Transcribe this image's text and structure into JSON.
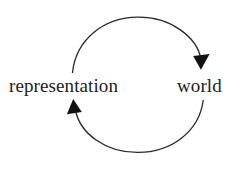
{
  "diagram": {
    "type": "cycle",
    "title": "",
    "background_color": "#ffffff",
    "stroke_color": "#2b2b2b",
    "text_color": "#1c1c1c",
    "nodes": [
      {
        "id": "representation",
        "label": "representation",
        "side": "left"
      },
      {
        "id": "world",
        "label": "world",
        "side": "right"
      }
    ],
    "edges": [
      {
        "id": "representation-to-world",
        "from": "representation",
        "to": "world",
        "label": "",
        "position": "top",
        "arrowhead": "solid-triangle",
        "arrowhead_direction": "down"
      },
      {
        "id": "world-to-representation",
        "from": "world",
        "to": "representation",
        "label": "",
        "position": "bottom",
        "arrowhead": "solid-triangle",
        "arrowhead_direction": "up"
      }
    ]
  }
}
